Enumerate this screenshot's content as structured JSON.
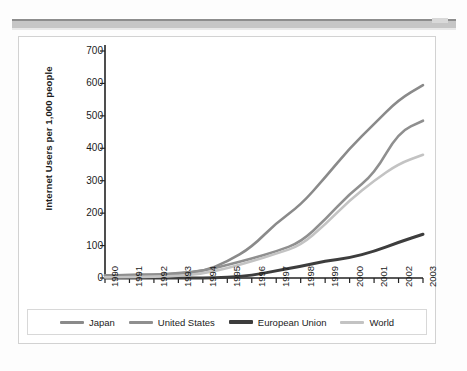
{
  "chart_data": {
    "type": "line",
    "title": "",
    "xlabel": "",
    "ylabel": "Internet Users per 1,000 people",
    "categories": [
      "1990",
      "1991",
      "1992",
      "1993",
      "1994",
      "1995",
      "1996",
      "1997",
      "1998",
      "1999",
      "2000",
      "2001",
      "2002",
      "2003"
    ],
    "x": [
      1990,
      1991,
      1992,
      1993,
      1994,
      1995,
      1996,
      1997,
      1998,
      1999,
      2000,
      2001,
      2002,
      2003
    ],
    "ylim": [
      0,
      700
    ],
    "yticks": [
      0,
      100,
      200,
      300,
      400,
      500,
      600,
      700
    ],
    "grid": false,
    "legend_position": "bottom",
    "series": [
      {
        "name": "Japan",
        "color": "#8a8a8a",
        "values": [
          8,
          9,
          10,
          13,
          20,
          50,
          95,
          170,
          225,
          310,
          400,
          475,
          550,
          595
        ]
      },
      {
        "name": "United States",
        "color": "#8f8f8f",
        "values": [
          8,
          9,
          11,
          14,
          22,
          40,
          60,
          82,
          110,
          180,
          260,
          320,
          450,
          485
        ]
      },
      {
        "name": "European Union",
        "color": "#3d3d3d",
        "values": [
          0,
          0,
          0,
          0,
          0,
          2,
          8,
          22,
          36,
          52,
          62,
          82,
          110,
          135
        ]
      },
      {
        "name": "World",
        "color": "#c3c3c3",
        "values": [
          2,
          3,
          4,
          6,
          14,
          30,
          52,
          75,
          100,
          165,
          240,
          300,
          352,
          380
        ]
      }
    ]
  },
  "legend": {
    "items": [
      {
        "label": "Japan",
        "color": "#8a8a8a"
      },
      {
        "label": "United States",
        "color": "#8f8f8f"
      },
      {
        "label": "European Union",
        "color": "#3d3d3d"
      },
      {
        "label": "World",
        "color": "#c3c3c3"
      }
    ]
  }
}
